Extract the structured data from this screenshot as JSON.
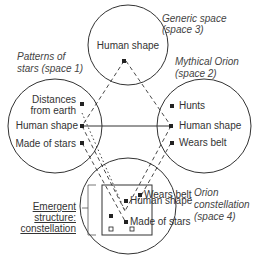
{
  "diagram": {
    "spaces": {
      "generic": {
        "title_line1": "Generic space",
        "title_line2": "(space 3)",
        "items": [
          "Human shape"
        ]
      },
      "patterns": {
        "title_line1": "Patterns of",
        "title_line2": "stars (space 1)",
        "items": [
          "Distances",
          "from earth",
          "Human shape",
          "Made of stars"
        ]
      },
      "mythical": {
        "title_line1": "Mythical Orion",
        "title_line2": "(space 2)",
        "items": [
          "Hunts",
          "Human shape",
          "Wears belt"
        ]
      },
      "orion": {
        "title_line1": "Orion",
        "title_line2": "constellation",
        "title_line3": "(space 4)",
        "items": [
          "Wears belt",
          "Human shape",
          "Made of stars"
        ]
      }
    },
    "emergent": {
      "line1": "Emergent",
      "line2": "structure:",
      "line3": "constellation"
    },
    "colors": {
      "stroke": "#333333",
      "text": "#333333"
    }
  }
}
